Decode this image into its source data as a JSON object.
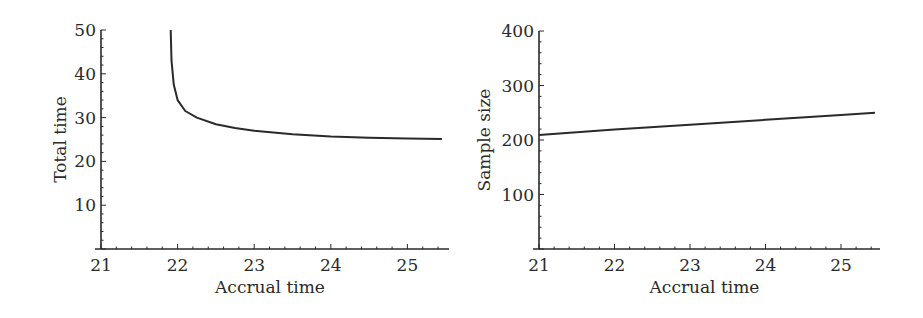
{
  "chart_data": [
    {
      "type": "line",
      "title": "",
      "xlabel": "Accrual time",
      "ylabel": "Total time",
      "xlim": [
        21,
        25.5
      ],
      "ylim": [
        0,
        50
      ],
      "xticks": [
        "21",
        "22",
        "23",
        "24",
        "25"
      ],
      "yticks": [
        "10",
        "20",
        "30",
        "40",
        "50"
      ],
      "grid": false,
      "legend": null,
      "series": [
        {
          "name": "Total time",
          "x": [
            21.91,
            21.92,
            21.95,
            22.0,
            22.1,
            22.25,
            22.5,
            22.75,
            23.0,
            23.5,
            24.0,
            24.5,
            25.0,
            25.45
          ],
          "y": [
            50,
            43,
            37.5,
            34,
            31.5,
            30,
            28.5,
            27.6,
            27,
            26.2,
            25.7,
            25.4,
            25.2,
            25.1
          ]
        }
      ]
    },
    {
      "type": "line",
      "title": "",
      "xlabel": "Accrual time",
      "ylabel": "Sample size",
      "xlim": [
        21,
        25.5
      ],
      "ylim": [
        0,
        400
      ],
      "xticks": [
        "21",
        "22",
        "23",
        "24",
        "25"
      ],
      "yticks": [
        "100",
        "200",
        "300",
        "400"
      ],
      "grid": false,
      "legend": null,
      "series": [
        {
          "name": "Sample size",
          "x": [
            21,
            22,
            23,
            24,
            25,
            25.45
          ],
          "y": [
            209,
            219,
            228,
            237,
            246,
            250
          ]
        }
      ]
    }
  ]
}
